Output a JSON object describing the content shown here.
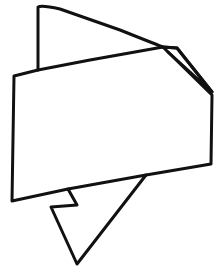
{
  "drawing": {
    "title": "",
    "subject": "folded ribbon banner line drawing",
    "stroke_color": "#111111",
    "background_color": "#ffffff"
  }
}
